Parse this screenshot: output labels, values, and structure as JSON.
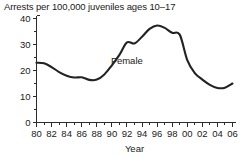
{
  "chart_data": {
    "type": "line",
    "title": "Arrests per 100,000 juveniles ages 10–17",
    "xlabel": "Year",
    "ylabel": "",
    "xlim": [
      1980,
      2006
    ],
    "ylim": [
      0,
      40
    ],
    "grid": false,
    "legend_position": "inline-annotation",
    "y_ticks": [
      0,
      10,
      20,
      30,
      40
    ],
    "y_tick_labels": [
      "0",
      "10",
      "20",
      "30",
      "40"
    ],
    "y_minor_ticks": [
      5,
      15,
      25,
      35
    ],
    "x_ticks": [
      1980,
      1981,
      1982,
      1983,
      1984,
      1985,
      1986,
      1987,
      1988,
      1989,
      1990,
      1991,
      1992,
      1993,
      1994,
      1995,
      1996,
      1997,
      1998,
      1999,
      2000,
      2001,
      2002,
      2003,
      2004,
      2005,
      2006
    ],
    "x_tick_labels": [
      "80",
      "",
      "82",
      "",
      "84",
      "",
      "86",
      "",
      "88",
      "",
      "90",
      "",
      "92",
      "",
      "94",
      "",
      "96",
      "",
      "98",
      "",
      "00",
      "",
      "02",
      "",
      "04",
      "",
      "06"
    ],
    "x_labeled_years": [
      1980,
      1982,
      1984,
      1986,
      1988,
      1990,
      1992,
      1994,
      1996,
      1998,
      2000,
      2002,
      2004,
      2006
    ],
    "annotations": [
      {
        "text": "Female",
        "x": 1992.0,
        "y": 22.5
      }
    ],
    "series": [
      {
        "name": "Female",
        "color": "#222222",
        "x": [
          1980,
          1981,
          1982,
          1983,
          1984,
          1985,
          1986,
          1987,
          1988,
          1989,
          1990,
          1991,
          1992,
          1993,
          1994,
          1995,
          1996,
          1997,
          1998,
          1999,
          2000,
          2001,
          2002,
          2003,
          2004,
          2005,
          2006
        ],
        "values": [
          23.0,
          22.8,
          21.3,
          19.4,
          18.0,
          17.3,
          17.4,
          16.4,
          16.5,
          18.5,
          22.0,
          26.0,
          30.8,
          30.4,
          33.0,
          36.0,
          37.3,
          36.4,
          34.5,
          33.8,
          28.0,
          19.5,
          17.8,
          16.6,
          15.2,
          14.0,
          13.3
        ],
        "values_note": "series continues",
        "linewidth": 2.1
      }
    ]
  },
  "chart_series_full": {
    "x": [
      1980,
      1981,
      1982,
      1983,
      1984,
      1985,
      1986,
      1987,
      1988,
      1989,
      1990,
      1991,
      1992,
      1993,
      1994,
      1995,
      1996,
      1997,
      1998,
      1999,
      2000,
      2001,
      2002,
      2003,
      2004,
      2005,
      2006
    ],
    "y": [
      23.0,
      22.8,
      21.3,
      19.4,
      18.0,
      17.3,
      17.4,
      16.4,
      16.5,
      18.5,
      22.0,
      26.0,
      30.8,
      30.4,
      33.0,
      36.0,
      37.3,
      36.4,
      34.5,
      33.8,
      24.0,
      19.0,
      16.5,
      14.5,
      13.3,
      13.4,
      15.0
    ]
  }
}
